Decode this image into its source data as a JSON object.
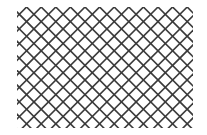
{
  "pattern": {
    "type": "diagonal-crosshatch",
    "stroke_color": "#3a3a3a",
    "background_color": "#ffffff",
    "region": {
      "x": 17,
      "y": 7,
      "width": 176,
      "height": 121
    },
    "spacing": 14.6,
    "stroke_width": 1.6,
    "angle_degrees": 45
  }
}
